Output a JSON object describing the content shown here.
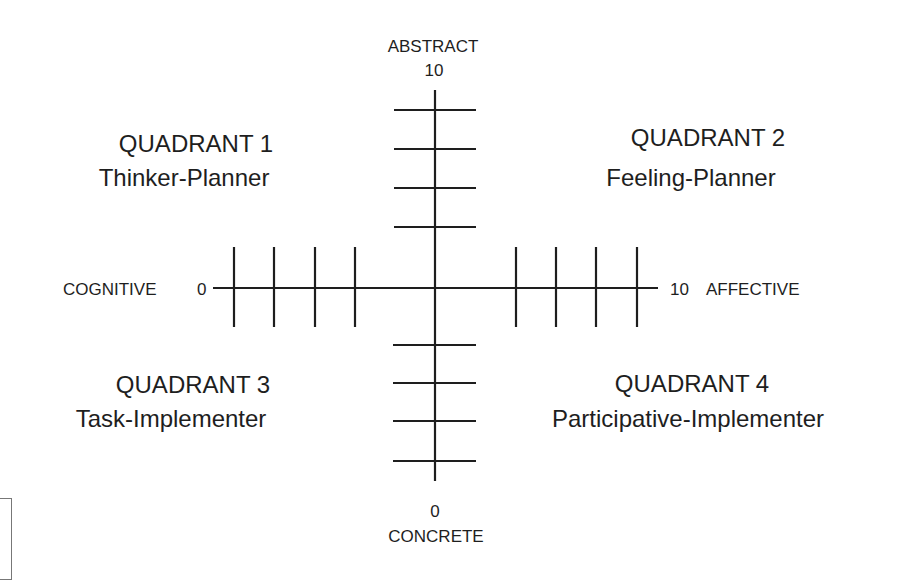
{
  "diagram": {
    "type": "quadrant-axis-diagram",
    "line_color": "#1e1e1e",
    "vertical_axis": {
      "top_label": "ABSTRACT",
      "top_value": "10",
      "bottom_value": "0",
      "bottom_label": "CONCRETE",
      "tick_count_per_side": 4
    },
    "horizontal_axis": {
      "left_label": "COGNITIVE",
      "left_value": "0",
      "right_value": "10",
      "right_label": "AFFECTIVE",
      "tick_count_per_side": 4
    },
    "quadrants": [
      {
        "title": "QUADRANT 1",
        "subtitle": "Thinker-Planner"
      },
      {
        "title": "QUADRANT 2",
        "subtitle": "Feeling-Planner"
      },
      {
        "title": "QUADRANT 3",
        "subtitle": "Task-Implementer"
      },
      {
        "title": "QUADRANT 4",
        "subtitle": "Participative-Implementer"
      }
    ]
  }
}
